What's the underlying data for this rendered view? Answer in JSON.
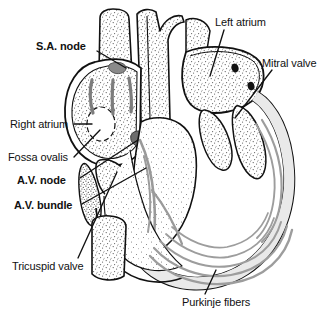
{
  "figure": {
    "kind": "anatomical-illustration",
    "background_color": "#ffffff",
    "ink_color": "#111111",
    "accent_gray": "#808080",
    "stipple_gray": "#6b6b6b"
  },
  "labels": {
    "sa_node": "S.A. node",
    "right_atrium": "Right atrium",
    "fossa_ovalis": "Fossa ovalis",
    "av_node": "A.V. node",
    "av_bundle": "A.V. bundle",
    "tricuspid_valve": "Tricuspid valve",
    "left_atrium": "Left atrium",
    "mitral_valve": "Mitral valve",
    "purkinje_fibers": "Purkinje fibers"
  },
  "label_styles": {
    "sa_node": "bold",
    "right_atrium": "regular",
    "fossa_ovalis": "regular",
    "av_node": "bold",
    "av_bundle": "bold",
    "tricuspid_valve": "regular",
    "left_atrium": "regular",
    "mitral_valve": "regular",
    "purkinje_fibers": "regular"
  }
}
